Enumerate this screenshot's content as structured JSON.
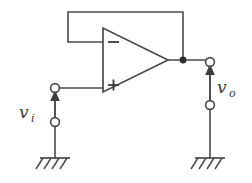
{
  "figure": {
    "name": "op-amp-voltage-follower",
    "background_color": "#ffffff",
    "stroke_color": "#4a4a4a",
    "label_color": "#3a3a3a",
    "width": 252,
    "height": 183
  },
  "opamp": {
    "name": "operational-amplifier",
    "inverting_label": "−",
    "noninverting_label": "+",
    "inverting_input_y": 42,
    "noninverting_input_y": 85,
    "output_y": 60
  },
  "input_port": {
    "name": "input-source-port",
    "label_var": "v",
    "label_sub": "i",
    "arrow_direction": "up",
    "top_terminal_y": 88,
    "bottom_terminal_y": 122,
    "x": 55
  },
  "output_port": {
    "name": "output-port",
    "label_var": "v",
    "label_sub": "o",
    "arrow_direction": "up",
    "top_terminal_y": 62,
    "bottom_terminal_y": 105,
    "x": 210
  },
  "feedback": {
    "name": "feedback-wire",
    "description": "unity gain feedback from output to inverting input",
    "top_y": 12,
    "left_x": 68,
    "right_x": 183
  },
  "grounds": [
    {
      "name": "ground-input-side",
      "x": 55,
      "y": 158
    },
    {
      "name": "ground-output-side",
      "x": 210,
      "y": 158
    }
  ],
  "junction": {
    "name": "output-junction-node",
    "x": 183,
    "y": 60
  }
}
